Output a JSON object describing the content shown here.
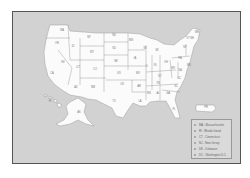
{
  "map": {
    "states": [
      {
        "abbr": "WA",
        "x": 62,
        "y": 31
      },
      {
        "abbr": "OR",
        "x": 57,
        "y": 44
      },
      {
        "abbr": "CA",
        "x": 52,
        "y": 74
      },
      {
        "abbr": "ID",
        "x": 73,
        "y": 47
      },
      {
        "abbr": "NV",
        "x": 63,
        "y": 63
      },
      {
        "abbr": "MT",
        "x": 89,
        "y": 38
      },
      {
        "abbr": "WY",
        "x": 92,
        "y": 53
      },
      {
        "abbr": "UT",
        "x": 78,
        "y": 68
      },
      {
        "abbr": "AZ",
        "x": 76,
        "y": 88
      },
      {
        "abbr": "CO",
        "x": 95,
        "y": 70
      },
      {
        "abbr": "NM",
        "x": 93,
        "y": 88
      },
      {
        "abbr": "ND",
        "x": 114,
        "y": 36
      },
      {
        "abbr": "SD",
        "x": 114,
        "y": 49
      },
      {
        "abbr": "NE",
        "x": 116,
        "y": 62
      },
      {
        "abbr": "KS",
        "x": 119,
        "y": 74
      },
      {
        "abbr": "OK",
        "x": 122,
        "y": 85
      },
      {
        "abbr": "TX",
        "x": 114,
        "y": 102
      },
      {
        "abbr": "MN",
        "x": 131,
        "y": 41
      },
      {
        "abbr": "IA",
        "x": 135,
        "y": 59
      },
      {
        "abbr": "MO",
        "x": 138,
        "y": 74
      },
      {
        "abbr": "AR",
        "x": 139,
        "y": 87
      },
      {
        "abbr": "LA",
        "x": 140,
        "y": 102
      },
      {
        "abbr": "WI",
        "x": 145,
        "y": 49
      },
      {
        "abbr": "IL",
        "x": 147,
        "y": 67
      },
      {
        "abbr": "MI",
        "x": 157,
        "y": 51
      },
      {
        "abbr": "IN",
        "x": 155,
        "y": 66
      },
      {
        "abbr": "OH",
        "x": 166,
        "y": 63
      },
      {
        "abbr": "KY",
        "x": 160,
        "y": 77
      },
      {
        "abbr": "TN",
        "x": 158,
        "y": 84
      },
      {
        "abbr": "MS",
        "x": 149,
        "y": 94
      },
      {
        "abbr": "AL",
        "x": 158,
        "y": 94
      },
      {
        "abbr": "GA",
        "x": 168,
        "y": 94
      },
      {
        "abbr": "FL",
        "x": 174,
        "y": 110
      },
      {
        "abbr": "SC",
        "x": 176,
        "y": 87
      },
      {
        "abbr": "NC",
        "x": 179,
        "y": 79
      },
      {
        "abbr": "VA",
        "x": 180,
        "y": 71
      },
      {
        "abbr": "WV",
        "x": 173,
        "y": 69
      },
      {
        "abbr": "PA",
        "x": 180,
        "y": 59
      },
      {
        "abbr": "NY",
        "x": 185,
        "y": 48
      },
      {
        "abbr": "VT",
        "x": 188,
        "y": 39
      },
      {
        "abbr": "NH",
        "x": 192,
        "y": 39
      },
      {
        "abbr": "ME",
        "x": 197,
        "y": 33
      },
      {
        "abbr": "MD",
        "x": 189,
        "y": 66
      },
      {
        "abbr": "AK",
        "x": 79,
        "y": 113
      },
      {
        "abbr": "HI",
        "x": 50,
        "y": 102
      },
      {
        "abbr": "PR",
        "x": 206,
        "y": 108
      }
    ]
  },
  "legend": {
    "items": [
      {
        "label": "MA - Massachusetts"
      },
      {
        "label": "RI - Rhode Island"
      },
      {
        "label": "CT - Connecticut"
      },
      {
        "label": "NJ - New Jersey"
      },
      {
        "label": "DE - Delaware"
      },
      {
        "label": "DC - Washington D.C."
      }
    ]
  },
  "colors": {
    "background": "#d2d2d2",
    "state_fill": "#fbfbfb",
    "border": "#555555"
  }
}
